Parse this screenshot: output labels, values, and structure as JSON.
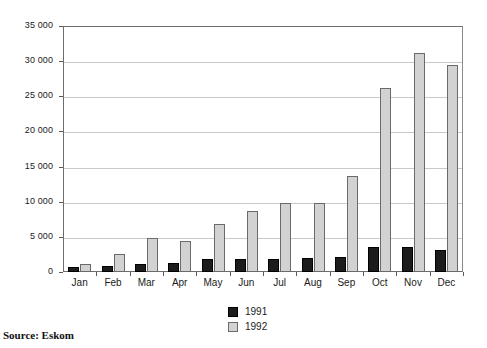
{
  "source_note": "Source: Eskom",
  "legend": {
    "position": "bottom-center",
    "entries": [
      {
        "label": "1991",
        "color": "#1c1c1c"
      },
      {
        "label": "1992",
        "color": "#d2d2d2"
      }
    ]
  },
  "chart_data": {
    "type": "bar",
    "title": "",
    "subtitle": "",
    "xlabel": "",
    "ylabel": "",
    "ylim": [
      0,
      35000
    ],
    "ytick_labels": [
      "0",
      "5 000",
      "10 000",
      "15 000",
      "20 000",
      "25 000",
      "30 000",
      "35 000"
    ],
    "ytick_values": [
      0,
      5000,
      10000,
      15000,
      20000,
      25000,
      30000,
      35000
    ],
    "grid": true,
    "grid_axis": "y",
    "legend_position": "bottom-center",
    "categories": [
      "Jan",
      "Feb",
      "Mar",
      "Apr",
      "May",
      "Jun",
      "Jul",
      "Aug",
      "Sep",
      "Oct",
      "Nov",
      "Dec"
    ],
    "series": [
      {
        "name": "1991",
        "color": "#1c1c1c",
        "values": [
          700,
          850,
          1100,
          1250,
          1850,
          1800,
          1900,
          2050,
          2150,
          3600,
          3600,
          3150
        ]
      },
      {
        "name": "1992",
        "color": "#d2d2d2",
        "values": [
          1100,
          2500,
          4900,
          4400,
          6850,
          8700,
          9850,
          9750,
          13700,
          26200,
          31100,
          29500
        ]
      }
    ]
  }
}
